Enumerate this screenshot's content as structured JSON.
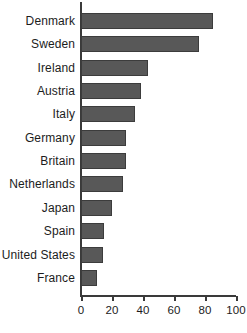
{
  "chart_data": {
    "type": "bar",
    "orientation": "horizontal",
    "title": "",
    "subtitle": "",
    "xlabel": "",
    "ylabel": "",
    "categories": [
      "Denmark",
      "Sweden",
      "Ireland",
      "Austria",
      "Italy",
      "Germany",
      "Britain",
      "Netherlands",
      "Japan",
      "Spain",
      "United States",
      "France"
    ],
    "values": [
      85,
      76,
      43,
      39,
      35,
      29,
      29,
      27,
      20,
      15,
      14,
      10
    ],
    "xlim": [
      0,
      100
    ],
    "ylim": null,
    "xticks": [
      0,
      20,
      40,
      60,
      80,
      100
    ],
    "xtick_labels": [
      "0",
      "20",
      "40",
      "60",
      "80",
      "100"
    ],
    "grid": false,
    "legend": null,
    "legend_position": "none",
    "annotations": [],
    "bar_color": "#585858",
    "bar_edge_color": "#3c3c3c",
    "axis_color": "#3a3a3a",
    "background_color": "#ffffff",
    "text_color": "#1c1c1c"
  }
}
